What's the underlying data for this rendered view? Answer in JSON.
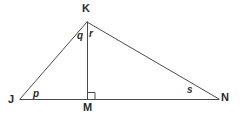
{
  "figure": {
    "kind": "geometry-diagram",
    "canvas": {
      "width": 247,
      "height": 121,
      "background": "#ffffff"
    },
    "stroke": {
      "color": "#4a4a4a",
      "width": 1
    },
    "text_color": "#2b2b2b",
    "vertices": [
      {
        "id": "K",
        "label": "K",
        "x": 87,
        "y": 22
      },
      {
        "id": "J",
        "label": "J",
        "x": 20,
        "y": 99
      },
      {
        "id": "N",
        "label": "N",
        "x": 219,
        "y": 99
      },
      {
        "id": "M",
        "label": "M",
        "x": 87,
        "y": 99
      }
    ],
    "segments": [
      {
        "id": "JK",
        "from": "J",
        "to": "K"
      },
      {
        "id": "KN",
        "from": "K",
        "to": "N"
      },
      {
        "id": "JN",
        "from": "J",
        "to": "N"
      },
      {
        "id": "KM",
        "from": "K",
        "to": "M"
      }
    ],
    "right_angle": {
      "at": "M",
      "marker": "square",
      "size": 7,
      "side": "right-of-altitude",
      "x": 88,
      "y": 92
    },
    "angle_labels": [
      {
        "id": "p",
        "label": "p",
        "at_vertex": "J",
        "x": 33,
        "y": 89
      },
      {
        "id": "q",
        "label": "q",
        "at_vertex": "K",
        "x": 77,
        "y": 31
      },
      {
        "id": "r",
        "label": "r",
        "at_vertex": "K",
        "x": 89,
        "y": 29
      },
      {
        "id": "s",
        "label": "s",
        "at_vertex": "N",
        "x": 187,
        "y": 85
      }
    ]
  }
}
